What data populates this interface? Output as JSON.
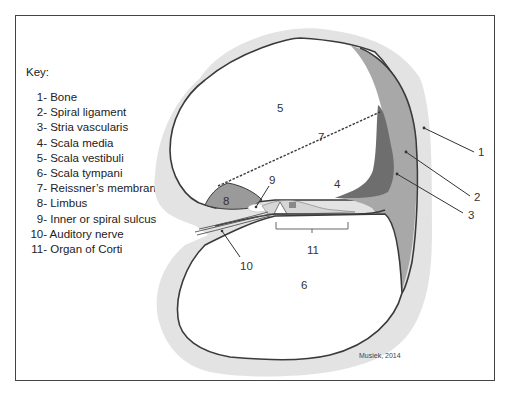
{
  "key": {
    "title": "Key:",
    "items": [
      {
        "num": "1-",
        "label": "Bone"
      },
      {
        "num": "2-",
        "label": "Spiral ligament"
      },
      {
        "num": "3-",
        "label": "Stria vascularis"
      },
      {
        "num": "4-",
        "label": "Scala media"
      },
      {
        "num": "5-",
        "label": "Scala vestibuli"
      },
      {
        "num": "6-",
        "label": "Scala tympani"
      },
      {
        "num": "7-",
        "label": "Reissner’s membrane"
      },
      {
        "num": "8-",
        "label": "Limbus"
      },
      {
        "num": "9-",
        "label": "Inner or spiral sulcus"
      },
      {
        "num": "10-",
        "label": "Auditory nerve"
      },
      {
        "num": "11-",
        "label": "Organ of Corti"
      }
    ]
  },
  "labels": {
    "l1": "1",
    "l2": "2",
    "l3": "3",
    "l4": "4",
    "l5": "5",
    "l6": "6",
    "l7": "7",
    "l8": "8",
    "l9": "9",
    "l10": "10",
    "l11": "11"
  },
  "credit": "Musiek, 2014",
  "colors": {
    "bone": "#e3e3e3",
    "outline": "#3a3a3a",
    "spiral_ligament": "#a8a8a8",
    "stria_vascularis": "#6e6e6e",
    "limbus": "#9a9a9a"
  }
}
